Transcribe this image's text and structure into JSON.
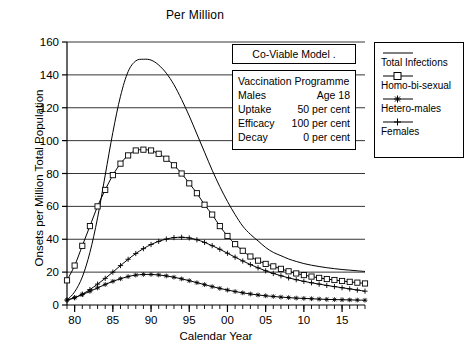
{
  "chart_data": {
    "type": "line",
    "title": "Per Million",
    "xlabel": "Calendar Year",
    "ylabel": "Onsets per Million Total Population",
    "xlim": [
      79,
      118
    ],
    "ylim": [
      0,
      160
    ],
    "yticks": [
      0,
      20,
      40,
      60,
      80,
      100,
      120,
      140,
      160
    ],
    "ytick_labels": [
      "0",
      "20",
      "40",
      "60",
      "80",
      "100",
      "120",
      "140",
      "160"
    ],
    "xticks": [
      80,
      85,
      90,
      95,
      100,
      105,
      110,
      115
    ],
    "xtick_labels": [
      "80",
      "85",
      "90",
      "95",
      "00",
      "05",
      "10",
      "15"
    ],
    "minor_xtick_step": 1,
    "grid": "horizontal",
    "legend_position": "outside-right",
    "x": [
      79,
      80,
      81,
      82,
      83,
      84,
      85,
      86,
      87,
      88,
      89,
      90,
      91,
      92,
      93,
      94,
      95,
      96,
      97,
      98,
      99,
      100,
      101,
      102,
      103,
      104,
      105,
      106,
      107,
      108,
      109,
      110,
      111,
      112,
      113,
      114,
      115,
      116,
      117,
      118
    ],
    "series": [
      {
        "name": "Total Infections",
        "marker": "none",
        "values": [
          3,
          8,
          17,
          32,
          53,
          79,
          105,
          127,
          142,
          148.5,
          149.5,
          149,
          146,
          141,
          134,
          125,
          115,
          104,
          93,
          82,
          72,
          63,
          55,
          48,
          43,
          39,
          35,
          32,
          30,
          28,
          26.5,
          25.2,
          24.2,
          23.4,
          22.7,
          22.1,
          21.6,
          21.2,
          20.8,
          20.4
        ]
      },
      {
        "name": "Homo-bi-sexual",
        "marker": "square",
        "values": [
          15,
          24,
          36,
          48,
          60,
          70,
          79,
          86,
          91,
          94,
          94.5,
          94,
          92,
          89,
          85,
          80,
          74,
          68,
          61,
          55,
          48,
          42,
          37,
          33,
          29.5,
          27,
          25,
          23.5,
          22,
          20.5,
          19.2,
          18.2,
          17.3,
          16.5,
          15.8,
          15.2,
          14.6,
          14.1,
          13.6,
          13.1
        ]
      },
      {
        "name": "Hetero-males",
        "marker": "asterisk",
        "values": [
          3,
          4.5,
          6.3,
          8.3,
          10.4,
          12.5,
          14.4,
          16,
          17.3,
          18.2,
          18.6,
          18.6,
          18.3,
          17.7,
          16.9,
          15.9,
          14.8,
          13.6,
          12.4,
          11.2,
          10.1,
          9.1,
          8.2,
          7.4,
          6.7,
          6.1,
          5.6,
          5.2,
          4.8,
          4.5,
          4.2,
          4.0,
          3.8,
          3.6,
          3.4,
          3.3,
          3.2,
          3.1,
          3.0,
          2.9
        ]
      },
      {
        "name": "Females",
        "marker": "plus",
        "values": [
          3,
          4.4,
          6.6,
          9.4,
          12.7,
          16.2,
          20,
          24,
          27.8,
          31.3,
          34.3,
          36.8,
          38.7,
          40.1,
          41,
          41.2,
          40.8,
          39.7,
          38.1,
          36.1,
          33.9,
          31.5,
          29.1,
          26.8,
          24.6,
          22.6,
          20.8,
          19.2,
          17.8,
          16.5,
          15.4,
          14.4,
          13.5,
          12.7,
          11.9,
          11.2,
          10.5,
          9.8,
          9.1,
          8.4
        ]
      }
    ],
    "annotations": {
      "covariable_box": {
        "text": "Co-Viable   Model ."
      },
      "vaccination_box": {
        "heading": "Vaccination Programme",
        "rows": [
          {
            "label": "Males",
            "value": "Age 18"
          },
          {
            "label": "Uptake",
            "value": "50 per cent"
          },
          {
            "label": "Efficacy",
            "value": "100 per cent"
          },
          {
            "label": "Decay",
            "value": "0 per cent"
          }
        ]
      }
    }
  },
  "legend": {
    "entries": [
      {
        "label": "Total Infections",
        "marker": "line"
      },
      {
        "label": "Homo-bi-sexual",
        "marker": "square"
      },
      {
        "label": "Hetero-males",
        "marker": "asterisk"
      },
      {
        "label": "Females",
        "marker": "plus"
      }
    ]
  }
}
